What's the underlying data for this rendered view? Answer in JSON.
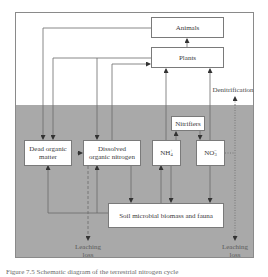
{
  "diagram": {
    "zones": {
      "above_ground": {
        "color": "#ffffff"
      },
      "soil": {
        "color": "#a9a9a9"
      }
    },
    "nodes": {
      "animals": "Animals",
      "plants": "Plants",
      "nitrifiers": "Nitrifiers",
      "dead_organic_matter_line1": "Dead organic",
      "dead_organic_matter_line2": "matter",
      "don_line1": "Dissolved",
      "don_line2": "organic nitrogen",
      "nh4": "NH",
      "nh4_sub": "4",
      "nh4_sup": "+",
      "no3": "NO",
      "no3_sub": "3",
      "no3_sup": "−",
      "soil_microbes": "Soil microbial biomass and fauna"
    },
    "labels": {
      "denitrification": "Denitrification",
      "leaching_left_line1": "Leaching",
      "leaching_left_line2": "loss",
      "leaching_right_line1": "Leaching",
      "leaching_right_line2": "loss"
    },
    "edges": [
      {
        "from": "Plants",
        "to": "Animals",
        "style": "solid"
      },
      {
        "from": "Animals",
        "to": "Dead organic matter",
        "style": "solid"
      },
      {
        "from": "Plants",
        "to": "Dead organic matter",
        "style": "solid"
      },
      {
        "from": "Plants",
        "to": "Dissolved organic nitrogen",
        "style": "solid"
      },
      {
        "from": "Dissolved organic nitrogen",
        "to": "Plants",
        "style": "solid"
      },
      {
        "from": "NH4+",
        "to": "Plants",
        "style": "solid"
      },
      {
        "from": "NO3-",
        "to": "Plants",
        "style": "solid"
      },
      {
        "from": "NH4+",
        "to": "Nitrifiers",
        "style": "solid"
      },
      {
        "from": "Nitrifiers",
        "to": "NO3-",
        "style": "solid"
      },
      {
        "from": "Dead organic matter",
        "to": "Dissolved organic nitrogen",
        "style": "solid"
      },
      {
        "from": "Soil microbial biomass and fauna",
        "to": "Dead organic matter",
        "style": "solid"
      },
      {
        "from": "Soil microbial biomass and fauna",
        "to": "Dissolved organic nitrogen",
        "style": "solid"
      },
      {
        "from": "Dissolved organic nitrogen",
        "to": "Soil microbial biomass and fauna",
        "style": "solid"
      },
      {
        "from": "Soil microbial biomass and fauna",
        "to": "NH4+",
        "style": "solid"
      },
      {
        "from": "NH4+",
        "to": "Soil microbial biomass and fauna",
        "style": "solid"
      },
      {
        "from": "NO3-",
        "to": "Soil microbial biomass and fauna",
        "style": "solid"
      },
      {
        "from": "Dissolved organic nitrogen",
        "to": "Leaching loss",
        "style": "dashed"
      },
      {
        "from": "NO3-",
        "to": "Denitrification",
        "style": "dotted"
      },
      {
        "from": "NO3-",
        "to": "Leaching loss",
        "style": "dotted"
      }
    ]
  },
  "caption": "Figure 7.5  Schematic diagram of the terrestrial nitrogen cycle"
}
